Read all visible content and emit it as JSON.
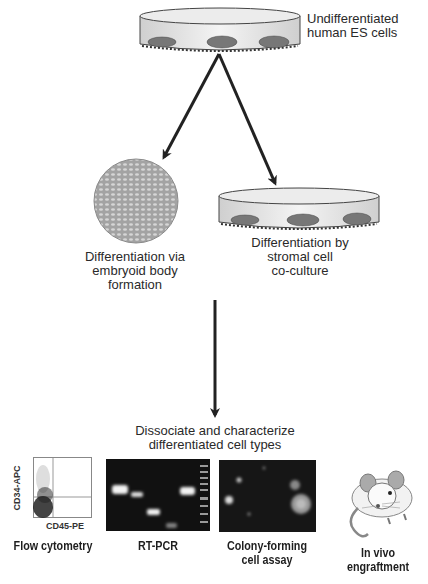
{
  "diagram": {
    "start": {
      "label_line1": "Undifferentiated",
      "label_line2": "human ES cells"
    },
    "branch_left": {
      "label_line1": "Differentiation via",
      "label_line2": "embryoid body",
      "label_line3": "formation"
    },
    "branch_right": {
      "label_line1": "Differentiation by",
      "label_line2": "stromal cell",
      "label_line3": "co-culture"
    },
    "merge": {
      "label_line1": "Dissociate and characterize",
      "label_line2": "differentiated cell types"
    },
    "assays": [
      {
        "label_line1": "Flow cytometry",
        "label_line2": ""
      },
      {
        "label_line1": "RT-PCR",
        "label_line2": ""
      },
      {
        "label_line1": "Colony-forming",
        "label_line2": "cell assay"
      },
      {
        "label_line1": "In vivo",
        "label_line2": "engraftment"
      }
    ],
    "flow_plot": {
      "y_axis_label": "CD34-APC",
      "x_axis_label": "CD45-PE"
    },
    "colors": {
      "arrow": "#222222",
      "dish_fill": "#e6e6e6",
      "sphere": "#a8a8a8",
      "gel_background": "#111111",
      "band": "#f2f2f2"
    }
  }
}
